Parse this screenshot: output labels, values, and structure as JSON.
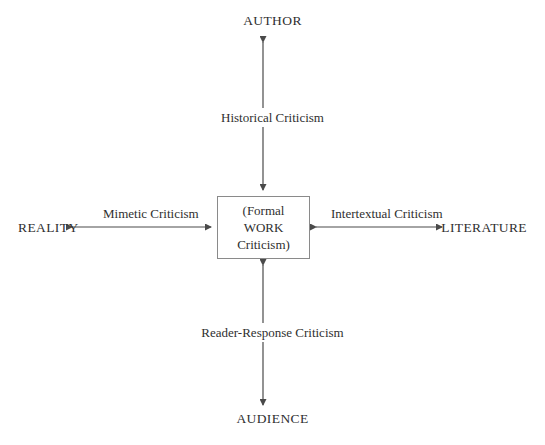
{
  "diagram": {
    "background_color": "#ffffff",
    "line_color": "#4a4a4a",
    "text_color": "#2f2f2f",
    "box_border_color": "#8a8a8a",
    "center": {
      "lines": [
        "(Formal",
        "WORK",
        "Criticism)"
      ]
    },
    "poles": {
      "top": "AUTHOR",
      "bottom": "AUDIENCE",
      "left": "REALITY",
      "right": "LITERATURE"
    },
    "axes": {
      "top": "Historical Criticism",
      "bottom": "Reader-Response Criticism",
      "left": "Mimetic Criticism",
      "right": "Intertextual Criticism"
    }
  }
}
